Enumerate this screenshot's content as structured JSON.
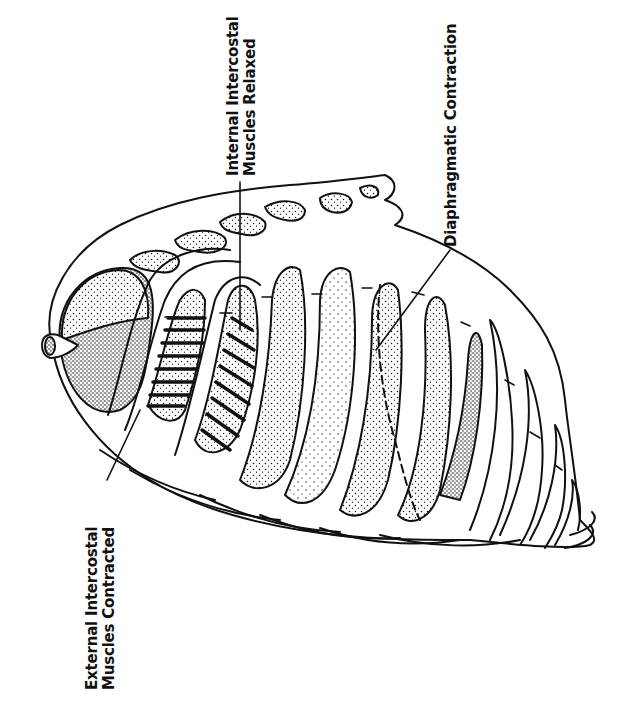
{
  "diagram": {
    "orientation": "rotated 90 degrees counter-clockwise",
    "colors": {
      "ink": "#111111",
      "background": "#ffffff"
    },
    "labels": {
      "internal": {
        "line1": "Internal Intercostal",
        "line2": "Muscles Relaxed"
      },
      "diaphragm": {
        "line1": "Diaphragmatic Contraction"
      },
      "external": {
        "line1": "External Intercostal",
        "line2": "Muscles Contracted"
      }
    }
  }
}
